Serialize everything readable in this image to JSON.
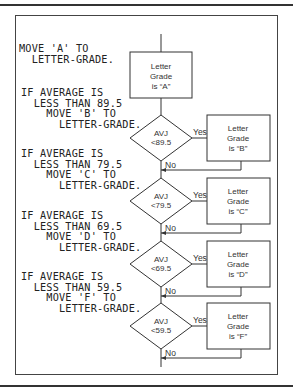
{
  "figure": {
    "code_blocks": [
      {
        "lines": [
          "MOVE 'A' TO",
          "  LETTER-GRADE."
        ]
      },
      {
        "lines": [
          "IF AVERAGE IS",
          "  LESS THAN 89.5",
          "    MOVE 'B' TO",
          "      LETTER-GRADE."
        ]
      },
      {
        "lines": [
          "IF AVERAGE IS",
          "  LESS THAN 79.5",
          "    MOVE 'C' TO",
          "      LETTER-GRADE."
        ]
      },
      {
        "lines": [
          "IF AVERAGE IS",
          "  LESS THAN 69.5",
          "    MOVE 'D' TO",
          "      LETTER-GRADE."
        ]
      },
      {
        "lines": [
          "IF AVERAGE IS",
          "  LESS THAN 59.5",
          "    MOVE 'F' TO",
          "      LETTER-GRADE."
        ]
      }
    ],
    "start_box": {
      "lines": [
        "Letter",
        "Grade",
        "is “A”"
      ]
    },
    "decisions": [
      {
        "line1": "AVJ",
        "line2": "<89.5",
        "yes": "Yes",
        "no": "No",
        "box": [
          "Letter",
          "Grade",
          "is “B”"
        ]
      },
      {
        "line1": "AVJ",
        "line2": "<79.5",
        "yes": "Yes",
        "no": "No",
        "box": [
          "Letter",
          "Grade",
          "is “C”"
        ]
      },
      {
        "line1": "AVJ",
        "line2": "<69.5",
        "yes": "Yes",
        "no": "No",
        "box": [
          "Letter",
          "Grade",
          "is “D”"
        ]
      },
      {
        "line1": "AVJ",
        "line2": "<59.5",
        "yes": "Yes",
        "no": "No",
        "box": [
          "Letter",
          "Grade",
          "is “F”"
        ]
      }
    ]
  }
}
